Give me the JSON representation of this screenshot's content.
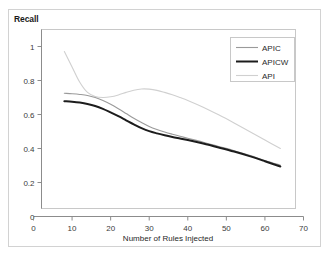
{
  "chart_data": {
    "type": "line",
    "title": "",
    "ylabel": "Recall",
    "xlabel": "Number of Rules Injected",
    "xlim": [
      0,
      70
    ],
    "ylim": [
      0,
      1.1
    ],
    "xticks": [
      "0",
      "10",
      "20",
      "30",
      "40",
      "50",
      "60",
      "70"
    ],
    "yticks": [
      "0",
      "0.2",
      "0.4",
      "0.6",
      "0.8",
      "1"
    ],
    "grid": false,
    "legend_position": "top-right-inside",
    "series": [
      {
        "name": "APIC",
        "color": "#9a9a9a",
        "width": 1.1,
        "x": [
          8,
          10,
          12,
          14,
          16,
          18,
          20,
          22,
          24,
          26,
          28,
          30,
          32,
          34,
          36,
          38,
          40,
          44,
          48,
          52,
          56,
          60,
          64
        ],
        "values": [
          0.725,
          0.722,
          0.718,
          0.712,
          0.7,
          0.682,
          0.66,
          0.634,
          0.606,
          0.578,
          0.553,
          0.53,
          0.512,
          0.497,
          0.484,
          0.472,
          0.46,
          0.437,
          0.412,
          0.387,
          0.36,
          0.33,
          0.302
        ]
      },
      {
        "name": "APICW",
        "color": "#1c1c1c",
        "width": 2.0,
        "x": [
          8,
          10,
          12,
          14,
          16,
          18,
          20,
          22,
          24,
          26,
          28,
          30,
          32,
          34,
          36,
          38,
          40,
          44,
          48,
          52,
          56,
          60,
          64
        ],
        "values": [
          0.678,
          0.675,
          0.67,
          0.662,
          0.65,
          0.633,
          0.612,
          0.59,
          0.566,
          0.542,
          0.52,
          0.502,
          0.489,
          0.478,
          0.468,
          0.459,
          0.45,
          0.429,
          0.406,
          0.382,
          0.355,
          0.325,
          0.294
        ]
      },
      {
        "name": "API",
        "color": "#d0d0d0",
        "width": 1.1,
        "x": [
          8,
          10,
          12,
          14,
          16,
          18,
          20,
          22,
          24,
          26,
          28,
          30,
          32,
          34,
          36,
          38,
          40,
          44,
          48,
          52,
          56,
          60,
          64
        ],
        "values": [
          0.97,
          0.88,
          0.79,
          0.73,
          0.706,
          0.7,
          0.704,
          0.715,
          0.73,
          0.743,
          0.75,
          0.749,
          0.742,
          0.73,
          0.716,
          0.7,
          0.683,
          0.643,
          0.598,
          0.55,
          0.5,
          0.45,
          0.4
        ]
      }
    ]
  },
  "legend": {
    "entries": [
      {
        "label": "APIC"
      },
      {
        "label": "APICW"
      },
      {
        "label": "API"
      }
    ]
  }
}
